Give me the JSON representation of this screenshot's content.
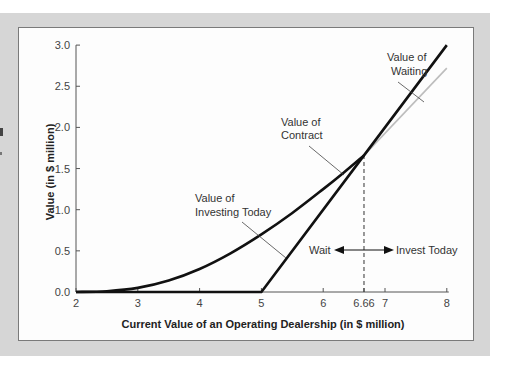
{
  "chart_data": {
    "type": "line",
    "title": "",
    "xlabel": "Current Value of an Operating Dealership (in $ million)",
    "ylabel": "Value (in $ million)",
    "xlim": [
      2,
      8
    ],
    "ylim": [
      0,
      3.0
    ],
    "x_ticks": [
      "2",
      "3",
      "4",
      "5",
      "6",
      "6.66",
      "7",
      "8"
    ],
    "y_ticks": [
      "0.0",
      "0.5",
      "1.0",
      "1.5",
      "2.0",
      "2.5",
      "3.0"
    ],
    "grid": false,
    "legend": null,
    "series": [
      {
        "name": "Value of Contract",
        "color": "#111111",
        "x": [
          2,
          2.5,
          3,
          3.5,
          4,
          4.5,
          5,
          5.5,
          6,
          6.33,
          6.66
        ],
        "values": [
          0.0,
          0.01,
          0.05,
          0.14,
          0.28,
          0.47,
          0.7,
          0.96,
          1.25,
          1.45,
          1.66
        ]
      },
      {
        "name": "Value of Waiting (contract value beyond 6.66)",
        "color": "#bdbdbd",
        "x": [
          6.66,
          8
        ],
        "values": [
          1.66,
          2.72
        ]
      },
      {
        "name": "Value of Investing Today",
        "color": "#111111",
        "x": [
          2,
          5,
          6.66,
          8
        ],
        "values": [
          0.0,
          0.0,
          1.66,
          3.0
        ]
      }
    ],
    "annotations": [
      {
        "text_lines": [
          "Value of",
          "Waiting"
        ],
        "points_to": [
          7.6,
          2.55
        ]
      },
      {
        "text_lines": [
          "Value of",
          "Contract"
        ],
        "points_to": [
          6.5,
          1.55
        ]
      },
      {
        "text_lines": [
          "Value of",
          "Investing Today"
        ],
        "points_to": [
          5.9,
          0.65
        ]
      },
      {
        "text": "Wait",
        "arrow": "left"
      },
      {
        "text": "Invest Today",
        "arrow": "right"
      }
    ],
    "reference_line": {
      "x": 6.66,
      "style": "dashed",
      "from": 0,
      "to": 1.66
    }
  },
  "labels": {
    "waiting_1": "Value of",
    "waiting_2": "Waiting",
    "contract_1": "Value of",
    "contract_2": "Contract",
    "investing_1": "Value of",
    "investing_2": "Investing Today",
    "wait": "Wait",
    "invest_today": "Invest Today"
  },
  "colors": {
    "panel": "#d6d6d6",
    "box_border": "#7a7a7a",
    "curve": "#111111",
    "gray_curve": "#bdbdbd",
    "axis": "#555555"
  }
}
